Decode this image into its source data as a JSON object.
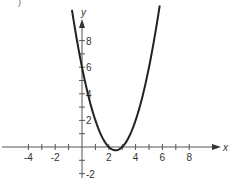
{
  "chart_data": {
    "type": "line",
    "title": "",
    "xlabel": "x",
    "ylabel": "y",
    "function": "y = x^2 - 5x + 6",
    "xlim": [
      -5.5,
      10.5
    ],
    "ylim": [
      -2.2,
      10.3
    ],
    "x_ticks": [
      -4,
      -3,
      -2,
      -1,
      1,
      2,
      3,
      4,
      5,
      6,
      7,
      8
    ],
    "x_tick_labels": [
      "-4",
      "-2",
      "2",
      "4",
      "6",
      "8"
    ],
    "x_tick_label_values": [
      -4,
      -2,
      2,
      4,
      6,
      8
    ],
    "y_ticks": [
      -2,
      -1,
      1,
      2,
      3,
      4,
      5,
      6,
      7,
      8
    ],
    "y_tick_labels": [
      "-2",
      "2",
      "4",
      "6",
      "8"
    ],
    "y_tick_label_values": [
      -2,
      2,
      4,
      6,
      8
    ],
    "grid": false,
    "legend": null,
    "series": [
      {
        "name": "parabola",
        "color": "#222222",
        "x": [
          -0.75,
          -0.5,
          0,
          0.5,
          1,
          1.5,
          2,
          2.5,
          3,
          3.5,
          4,
          4.5,
          5,
          5.5,
          5.8
        ],
        "y": [
          10.31,
          8.75,
          6,
          3.75,
          2,
          0.75,
          0,
          -0.25,
          0,
          0.75,
          2,
          3.75,
          6,
          8.75,
          10.64
        ]
      }
    ],
    "annotations": {
      "vertex": [
        2.5,
        -0.25
      ],
      "x_intercepts": [
        2,
        3
      ],
      "y_intercept": 6
    }
  },
  "corner_fragment": ")"
}
